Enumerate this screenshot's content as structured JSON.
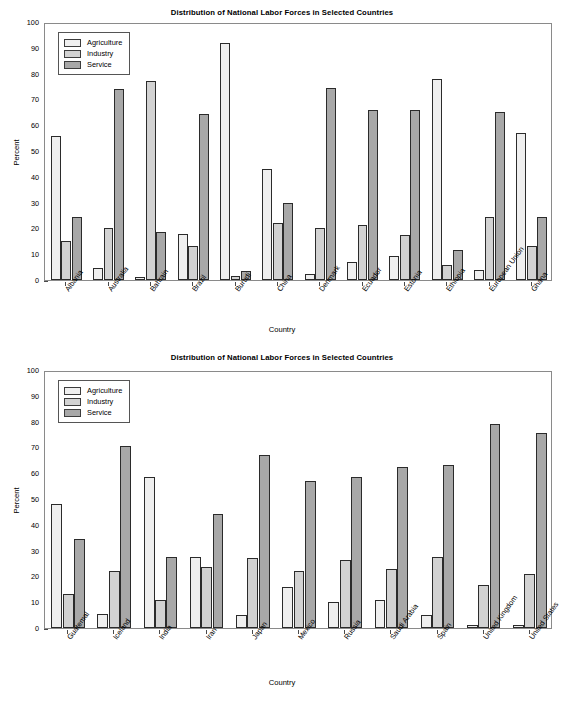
{
  "charts": [
    {
      "title": "Distribution of National Labor Forces in Selected Countries",
      "ylabel": "Percent",
      "xlabel": "Country",
      "legend": [
        {
          "label": "Agriculture",
          "color": "#efefef"
        },
        {
          "label": "Industry",
          "color": "#d2d2d2"
        },
        {
          "label": "Service",
          "color": "#a8a8a8"
        }
      ],
      "yticks": [
        "0",
        "10",
        "20",
        "30",
        "40",
        "50",
        "60",
        "70",
        "80",
        "90",
        "100"
      ]
    },
    {
      "title": "Distribution of National Labor Forces in Selected Countries",
      "ylabel": "Percent",
      "xlabel": "Country",
      "legend": [
        {
          "label": "Agriculture",
          "color": "#efefef"
        },
        {
          "label": "Industry",
          "color": "#d2d2d2"
        },
        {
          "label": "Service",
          "color": "#a8a8a8"
        }
      ],
      "yticks": [
        "0",
        "10",
        "20",
        "30",
        "40",
        "50",
        "60",
        "70",
        "80",
        "90",
        "100"
      ]
    }
  ],
  "chart_data": [
    {
      "type": "bar",
      "title": "Distribution of National Labor Forces in Selected Countries",
      "xlabel": "Country",
      "ylabel": "Percent",
      "ylim": [
        0,
        100
      ],
      "ytick_step": 10,
      "grid": false,
      "legend_position": "top-left",
      "categories": [
        "Albania",
        "Australia",
        "Bahrain",
        "Brazil",
        "Burudi",
        "China",
        "Denmark",
        "Ecuador",
        "Estonia",
        "Ethiopia",
        "European Union",
        "Ghana"
      ],
      "series": [
        {
          "name": "Agriculture",
          "color": "#efefef",
          "values": [
            56,
            4.5,
            1,
            18,
            92,
            43,
            2.5,
            7,
            9.5,
            78,
            4,
            57
          ]
        },
        {
          "name": "Industry",
          "color": "#d2d2d2",
          "values": [
            15,
            20,
            77,
            13,
            1.5,
            22,
            20,
            21.5,
            17.5,
            6,
            24.5,
            13
          ]
        },
        {
          "name": "Service",
          "color": "#a8a8a8",
          "values": [
            24.5,
            74,
            18.5,
            64.5,
            3.5,
            30,
            74.5,
            66,
            66,
            11.5,
            65,
            24.5
          ]
        }
      ]
    },
    {
      "type": "bar",
      "title": "Distribution of National Labor Forces in Selected Countries",
      "xlabel": "Country",
      "ylabel": "Percent",
      "ylim": [
        0,
        100
      ],
      "ytick_step": 10,
      "grid": false,
      "legend_position": "top-left",
      "categories": [
        "Guatemal",
        "Iceland",
        "India",
        "Iran",
        "Japan",
        "Mexico",
        "Russia",
        "Saudi Arabia",
        "Spain",
        "United Kingdom",
        "United States"
      ],
      "series": [
        {
          "name": "Agriculture",
          "color": "#efefef",
          "values": [
            48,
            5.5,
            58.5,
            27.5,
            5,
            16,
            10,
            11,
            5,
            1,
            1
          ]
        },
        {
          "name": "Industry",
          "color": "#d2d2d2",
          "values": [
            13,
            22,
            11,
            23.5,
            27,
            22,
            26.5,
            23,
            27.5,
            16.5,
            21
          ]
        },
        {
          "name": "Service",
          "color": "#a8a8a8",
          "values": [
            34.5,
            70.5,
            27.5,
            44,
            67,
            57,
            58.5,
            62.5,
            63,
            79,
            75.5
          ]
        }
      ]
    }
  ]
}
